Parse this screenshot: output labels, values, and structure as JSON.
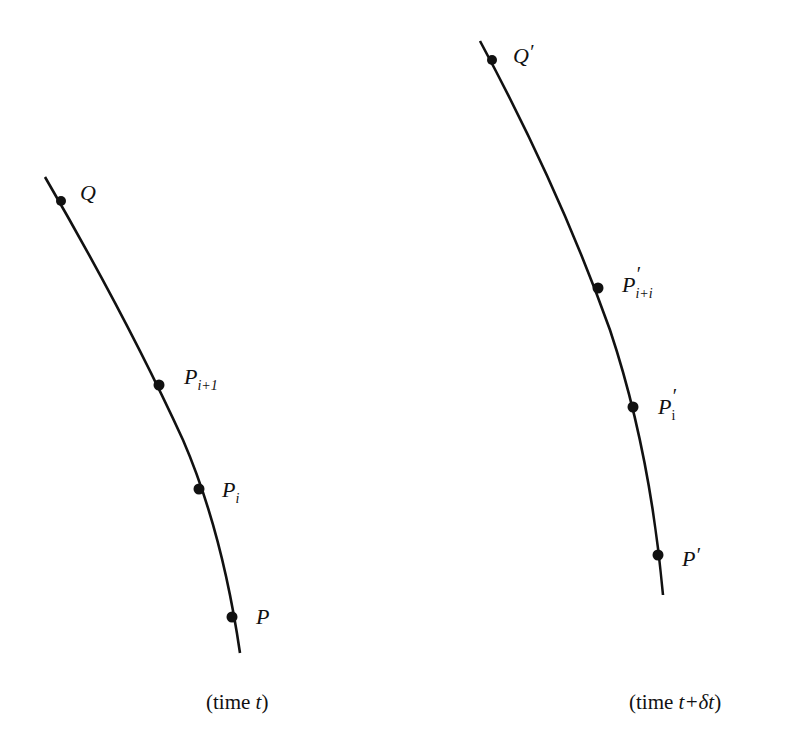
{
  "diagram": {
    "curves": [
      {
        "name": "curve-time-t",
        "path": "M45,177 Q128,320 183,440 Q222,530 240,653",
        "points": [
          {
            "id": "Q",
            "x": 61,
            "y": 201,
            "label": "Q",
            "sub": "",
            "prime": ""
          },
          {
            "id": "P_i+1",
            "x": 159,
            "y": 385,
            "label": "P",
            "sub": "i+1",
            "prime": ""
          },
          {
            "id": "P_i",
            "x": 199,
            "y": 489,
            "label": "P",
            "sub": "i",
            "prime": ""
          },
          {
            "id": "P",
            "x": 232,
            "y": 617,
            "label": "P",
            "sub": "",
            "prime": ""
          }
        ],
        "caption_prefix": "(time ",
        "caption_var": "t",
        "caption_suffix": ")"
      },
      {
        "name": "curve-time-t-plus-dt",
        "path": "M480,41 Q560,190 610,330 Q650,450 663,595",
        "points": [
          {
            "id": "Q'",
            "x": 492,
            "y": 60,
            "label": "Q",
            "sub": "",
            "prime": "′"
          },
          {
            "id": "P'_i+i",
            "x": 598,
            "y": 288,
            "label": "P",
            "sub": "i+i",
            "prime": "′"
          },
          {
            "id": "P'_i",
            "x": 633,
            "y": 407,
            "label": "P",
            "sub": "i",
            "prime": "′"
          },
          {
            "id": "P'",
            "x": 658,
            "y": 555,
            "label": "P",
            "sub": "",
            "prime": "′"
          }
        ],
        "caption_prefix": "(time ",
        "caption_var": "t+δt",
        "caption_suffix": ")"
      }
    ],
    "stroke_color": "#111111",
    "background": "#ffffff"
  }
}
